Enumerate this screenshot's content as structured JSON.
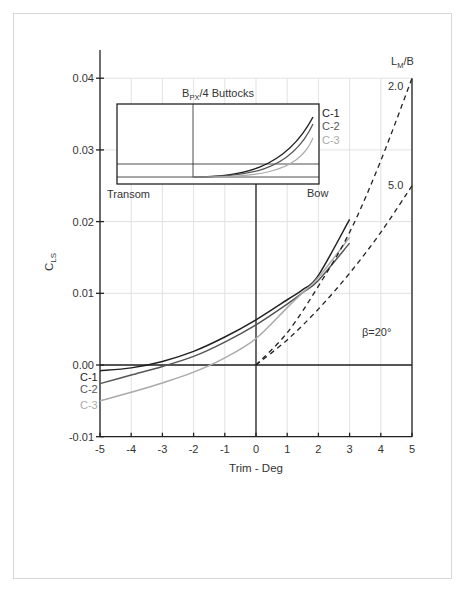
{
  "chart_data": {
    "type": "line",
    "title": "",
    "xlabel": "Trim - Deg",
    "ylabel": "C_LS",
    "ylabel_main": "C",
    "ylabel_sub": "LS",
    "xlim": [
      -5,
      5
    ],
    "ylim": [
      -0.01,
      0.04
    ],
    "x_ticks": [
      "-5",
      "-4",
      "-3",
      "-2",
      "-1",
      "0",
      "1",
      "2",
      "3",
      "4",
      "5"
    ],
    "y_ticks": [
      "0.04",
      "0.03",
      "0.02",
      "0.01",
      "0.00",
      "-0.01"
    ],
    "grid": true,
    "series": [
      {
        "name": "C-1",
        "color": "#222222",
        "style": "solid",
        "x": [
          -5,
          -4,
          -3,
          -2,
          -1,
          0,
          1,
          1.5,
          2,
          3
        ],
        "y": [
          -0.0008,
          -0.0004,
          0.0005,
          0.0019,
          0.0039,
          0.0063,
          0.0091,
          0.0105,
          0.0125,
          0.0203
        ]
      },
      {
        "name": "C-2",
        "color": "#555555",
        "style": "solid",
        "x": [
          -5,
          -4,
          -3,
          -2,
          -1,
          0,
          1,
          1.5,
          2,
          3
        ],
        "y": [
          -0.0026,
          -0.0014,
          -0.0002,
          0.0012,
          0.0032,
          0.0056,
          0.0085,
          0.0101,
          0.0118,
          0.017
        ]
      },
      {
        "name": "C-3",
        "color": "#aaaaaa",
        "style": "solid",
        "x": [
          -5,
          -4,
          -3,
          -2,
          -1,
          0,
          1,
          1.5,
          2,
          3
        ],
        "y": [
          -0.005,
          -0.0038,
          -0.0025,
          -0.001,
          0.001,
          0.0037,
          0.008,
          0.0101,
          0.0122,
          0.0178
        ]
      },
      {
        "name": "L_M/B = 2.0",
        "color": "#222222",
        "style": "dashed",
        "x": [
          0,
          1,
          2,
          3,
          4,
          5
        ],
        "y": [
          0.0,
          0.0045,
          0.011,
          0.0185,
          0.0285,
          0.04
        ]
      },
      {
        "name": "L_M/B = 5.0",
        "color": "#222222",
        "style": "dashed",
        "x": [
          0,
          1,
          2,
          3,
          4,
          5
        ],
        "y": [
          0.0,
          0.0035,
          0.0078,
          0.0128,
          0.0185,
          0.025
        ]
      }
    ],
    "annotations": {
      "lmb_header": "L",
      "lmb_header_sub": "M",
      "lmb_header_tail": "/B",
      "lmb_2": "2.0",
      "lmb_5": "5.0",
      "beta": "β=20°",
      "legend_left": [
        "C-1",
        "C-2",
        "C-3"
      ]
    },
    "inset": {
      "title_main": "B",
      "title_sub": "PX",
      "title_tail": "/4 Buttocks",
      "left_label": "Transom",
      "right_label": "Bow",
      "legend": [
        "C-1",
        "C-2",
        "C-3"
      ]
    }
  }
}
